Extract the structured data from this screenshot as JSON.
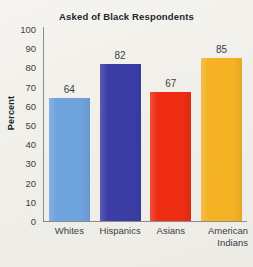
{
  "chart_data": {
    "type": "bar",
    "title": "Asked of Black Respondents",
    "xlabel": "",
    "ylabel": "Percent",
    "categories": [
      "Whites",
      "Hispanics",
      "Asians",
      "American Indians"
    ],
    "values": [
      64,
      82,
      67,
      85
    ],
    "ylim": [
      0,
      100
    ],
    "ytick_labels": [
      "100",
      "90",
      "80",
      "70",
      "60",
      "50",
      "40",
      "30",
      "20",
      "10",
      "0"
    ],
    "ytick_values": [
      100,
      90,
      80,
      70,
      60,
      50,
      40,
      30,
      20,
      10,
      0
    ],
    "grid": false,
    "legend": "none",
    "bar_colors": [
      "#6fa3de",
      "#3b3da5",
      "#ee2d14",
      "#f5b225"
    ],
    "value_labels": [
      "64",
      "82",
      "67",
      "85"
    ],
    "category_label_lines": [
      [
        "Whites"
      ],
      [
        "Hispanics"
      ],
      [
        "Asians"
      ],
      [
        "American",
        "Indians"
      ]
    ]
  },
  "page": {
    "background_color": "#f2f0ea",
    "axis_color": "#8d8b87",
    "text_color": "#3b3e43",
    "title_color": "#23262b"
  }
}
